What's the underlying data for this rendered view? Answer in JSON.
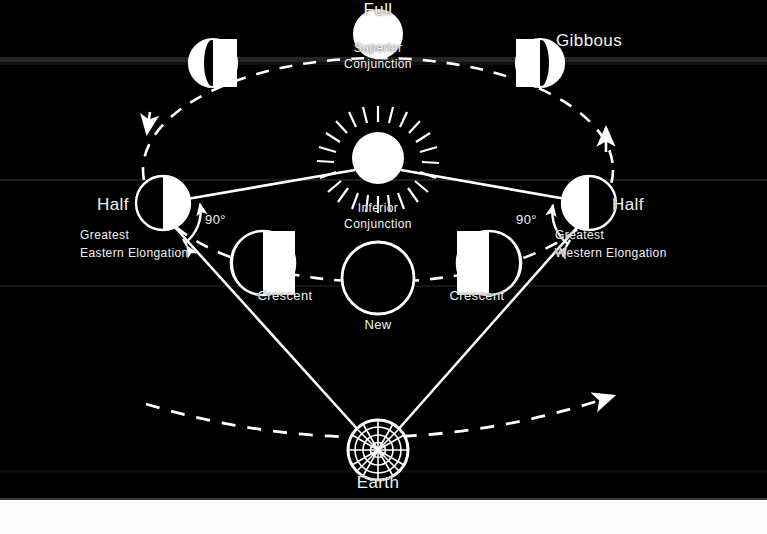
{
  "figure": {
    "background_color": "#000000",
    "stroke_color": "#ffffff",
    "text_color": "#f2f2f2"
  },
  "bodies": {
    "sun": {
      "label": "",
      "cx": 378,
      "cy": 157,
      "r": 26,
      "icon": "sun-with-rays"
    },
    "earth": {
      "label": "Earth",
      "cx": 378,
      "cy": 450,
      "r": 30,
      "icon": "earth-globe-grid"
    }
  },
  "phases": [
    {
      "id": "gibbous-left",
      "label": "Gibbous",
      "label_visible": false,
      "cx": 213,
      "cy": 63,
      "r": 24,
      "lit": "right-gibbous",
      "description": "waning gibbous, dark sliver on left limb"
    },
    {
      "id": "full",
      "label": "Full",
      "label_visible": true,
      "cx": 378,
      "cy": 34,
      "r": 24,
      "lit": "full",
      "description": "fully illuminated disk",
      "sub_label": "Superior\nConjunction"
    },
    {
      "id": "gibbous-right",
      "label": "Gibbous",
      "label_visible": true,
      "cx": 540,
      "cy": 63,
      "r": 24,
      "lit": "left-gibbous",
      "description": "gibbous, dark sliver on right limb"
    },
    {
      "id": "half-left",
      "label": "Half",
      "label_visible": true,
      "cx": 163,
      "cy": 203,
      "r": 27,
      "lit": "right-half",
      "description": "half lit on right side",
      "sub_label": "Greatest\nEastern Elongation",
      "angle_label": "90°"
    },
    {
      "id": "crescent-left",
      "label": "Crescent",
      "label_visible": true,
      "cx": 263,
      "cy": 263,
      "r": 32,
      "lit": "right-crescent",
      "description": "thin crescent lit on right limb"
    },
    {
      "id": "new",
      "label": "New",
      "label_visible": true,
      "cx": 378,
      "cy": 278,
      "r": 36,
      "lit": "new",
      "description": "unlit disk, outline only"
    },
    {
      "id": "crescent-right",
      "label": "Crescent",
      "label_visible": true,
      "cx": 489,
      "cy": 263,
      "r": 32,
      "lit": "left-crescent",
      "description": "thin crescent lit on left limb"
    },
    {
      "id": "half-right",
      "label": "Half",
      "label_visible": true,
      "cx": 589,
      "cy": 203,
      "r": 27,
      "lit": "left-half",
      "description": "half lit on left side",
      "sub_label": "Greatest\nWestern Elongation",
      "angle_label": "90°"
    }
  ],
  "labels": {
    "full": "Full",
    "superior_conjunction_line1": "Superior",
    "superior_conjunction_line2": "Conjunction",
    "gibbous_right": "Gibbous",
    "half_left": "Half",
    "greatest_eastern_line1": "Greatest",
    "greatest_eastern_line2": "Eastern Elongation",
    "angle_left": "90°",
    "inferior_conjunction_line1": "Inferior",
    "inferior_conjunction_line2": "Conjunction",
    "half_right": "Half",
    "greatest_western_line1": "Greatest",
    "greatest_western_line2": "Western Elongation",
    "angle_right": "90°",
    "crescent_left": "Crescent",
    "crescent_right": "Crescent",
    "new": "New",
    "earth": "Earth"
  },
  "orbits": {
    "planet_orbit": {
      "name": "inferior-planet-orbit",
      "style": "dashed",
      "direction_arrows": [
        {
          "id": "arrow-left-down",
          "x": 148,
          "y": 130,
          "points": "down"
        },
        {
          "id": "arrow-right-up",
          "x": 607,
          "y": 131,
          "points": "up"
        }
      ]
    },
    "earth_orbit": {
      "name": "earth-orbit-arc",
      "style": "dashed",
      "direction_arrows": [
        {
          "id": "arrow-earth-orbit",
          "x": 618,
          "y": 394,
          "points": "up-right"
        }
      ]
    }
  },
  "sight_lines": {
    "name": "earth-tangent-sight-lines",
    "style": "solid",
    "from": "earth",
    "to": [
      "half-left",
      "half-right"
    ]
  },
  "sun_lines": {
    "name": "sun-to-elongation-lines",
    "style": "solid",
    "from": "sun",
    "to": [
      "half-left",
      "half-right"
    ]
  }
}
